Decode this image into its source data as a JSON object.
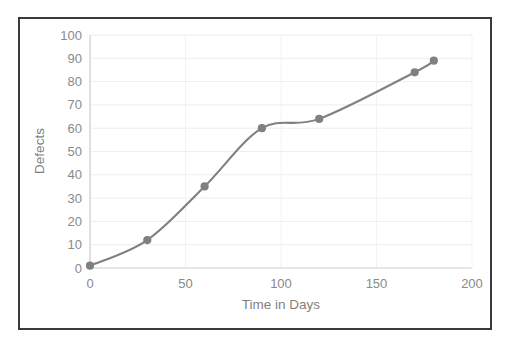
{
  "chart_data": {
    "type": "line",
    "title": "",
    "xlabel": "Time in Days",
    "ylabel": "Defects",
    "x": [
      0,
      30,
      60,
      90,
      120,
      170,
      180
    ],
    "values": [
      1,
      12,
      35,
      60,
      64,
      84,
      89
    ],
    "series": [
      {
        "name": "Defects",
        "x": [
          0,
          30,
          60,
          90,
          120,
          170,
          180
        ],
        "values": [
          1,
          12,
          35,
          60,
          64,
          84,
          89
        ]
      }
    ],
    "xlim": [
      0,
      200
    ],
    "ylim": [
      0,
      100
    ],
    "xticks": [
      0,
      50,
      100,
      150,
      200
    ],
    "yticks": [
      0,
      10,
      20,
      30,
      40,
      50,
      60,
      70,
      80,
      90,
      100
    ],
    "xtick_labels": [
      "0",
      "50",
      "100",
      "150",
      "200"
    ],
    "ytick_labels": [
      "0",
      "10",
      "20",
      "30",
      "40",
      "50",
      "60",
      "70",
      "80",
      "90",
      "100"
    ],
    "grid": true,
    "grid_axis": "both",
    "legend": false,
    "legend_position": "none",
    "marker": "circle",
    "smooth": true,
    "line_color": "#808080",
    "marker_color": "#808080",
    "grid_color": "#ededf2",
    "tick_label_color": "#8a8a8a",
    "axis_title_color": "#7f7f7f",
    "plot_background": "#ffffff",
    "border_color": "#3a3a3a"
  }
}
